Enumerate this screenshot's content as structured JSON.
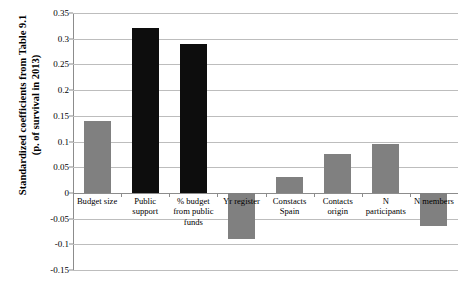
{
  "chart_data": {
    "type": "bar",
    "title": "",
    "xlabel": "",
    "ylabel": "Standardized coefficients from Table 9.1 (p. of survival in 2013)",
    "ylabel_line1": "Standardized coefficients from Table 9.1",
    "ylabel_line2": "(p. of survival in 2013)",
    "categories": [
      "Budget size",
      "Public support",
      "% budget from public funds",
      "Yr register",
      "Constacts Spain",
      "Contacts origin",
      "N participants",
      "N members"
    ],
    "category_lines": [
      [
        "Budget size"
      ],
      [
        "Public",
        "support"
      ],
      [
        "% budget",
        "from public",
        "funds"
      ],
      [
        "Yr register"
      ],
      [
        "Constacts",
        "Spain"
      ],
      [
        "Contacts",
        "origin"
      ],
      [
        "N",
        "participants"
      ],
      [
        "N members"
      ]
    ],
    "values": [
      0.14,
      0.32,
      0.29,
      -0.09,
      0.03,
      0.075,
      0.095,
      -0.065
    ],
    "bar_colors": [
      "#808080",
      "#0d0d0d",
      "#0d0d0d",
      "#808080",
      "#808080",
      "#808080",
      "#808080",
      "#808080"
    ],
    "ylim": [
      -0.15,
      0.35
    ],
    "ytick_values": [
      0.35,
      0.3,
      0.25,
      0.2,
      0.15,
      0.1,
      0.05,
      0,
      -0.05,
      -0.1,
      -0.15
    ],
    "ytick_labels": [
      "0.35",
      "0.3",
      "0.25",
      "0.2",
      "0.15",
      "0.1",
      "0.05",
      "0",
      "-0.05",
      "-0.1",
      "-0.15"
    ],
    "grid": true,
    "legend": "none",
    "colors": {
      "gray_bar": "#808080",
      "black_bar": "#0d0d0d",
      "gridline": "#bdbdbd",
      "axis": "#8c8c8c",
      "background": "#ffffff"
    }
  }
}
